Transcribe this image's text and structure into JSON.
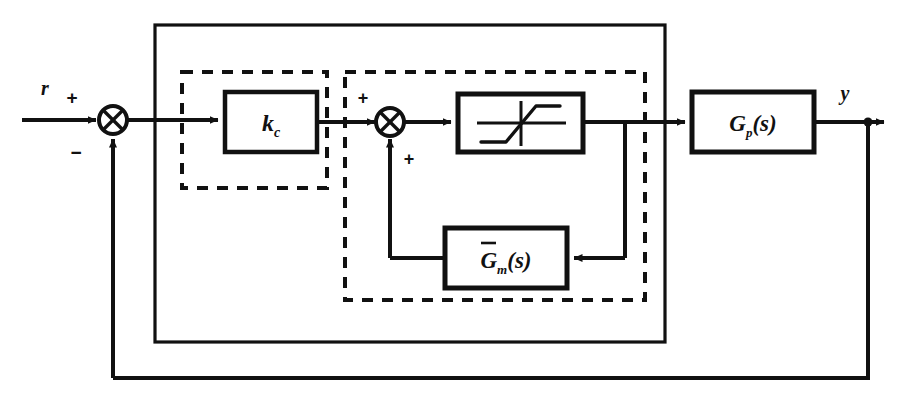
{
  "diagram": {
    "type": "control-block-diagram",
    "canvas": {
      "width": 908,
      "height": 400,
      "background": "#ffffff"
    },
    "line_color": "#111111",
    "signals": {
      "reference_label": "r",
      "output_label": "y"
    },
    "summing_junctions": [
      {
        "name": "error-summer",
        "cx": 113,
        "cy": 120,
        "r": 14,
        "sign_top": "+",
        "sign_bottom": "−"
      },
      {
        "name": "inner-summer",
        "cx": 390,
        "cy": 122,
        "r": 14,
        "sign_top": "+",
        "sign_bottom": "+"
      }
    ],
    "blocks": [
      {
        "name": "controller-gain-block",
        "label_main": "k",
        "label_sub": "c",
        "label_tail": "",
        "overbar": false,
        "x": 225,
        "y": 92,
        "w": 92,
        "h": 60
      },
      {
        "name": "saturation-block",
        "label_main": "",
        "label_sub": "",
        "label_tail": "",
        "overbar": false,
        "icon": "saturation-nonlinearity-icon",
        "x": 458,
        "y": 94,
        "w": 125,
        "h": 58
      },
      {
        "name": "model-transfer-function-block",
        "label_main": "G",
        "label_sub": "m",
        "label_tail": "(s)",
        "overbar": true,
        "x": 445,
        "y": 228,
        "w": 122,
        "h": 60
      },
      {
        "name": "plant-transfer-function-block",
        "label_main": "G",
        "label_sub": "p",
        "label_tail": "(s)",
        "overbar": false,
        "x": 692,
        "y": 92,
        "w": 122,
        "h": 60
      }
    ],
    "groups": [
      {
        "name": "outer-solid-group",
        "style": "solid",
        "x": 155,
        "y": 25,
        "w": 510,
        "h": 317
      },
      {
        "name": "controller-dashed-group",
        "style": "dashed",
        "x": 182,
        "y": 72,
        "w": 145,
        "h": 116
      },
      {
        "name": "antiwindup-dashed-group",
        "style": "dashed",
        "x": 345,
        "y": 72,
        "w": 300,
        "h": 228
      }
    ],
    "paths": {
      "reference_in_x_start": 22,
      "output_arrow_x_end": 884,
      "outer_feedback_y": 378,
      "outer_feedback_tap_x": 868,
      "inner_feedback_tap_x": 625,
      "inner_feedback_y": 258,
      "inner_feedback_return_x": 390
    }
  }
}
